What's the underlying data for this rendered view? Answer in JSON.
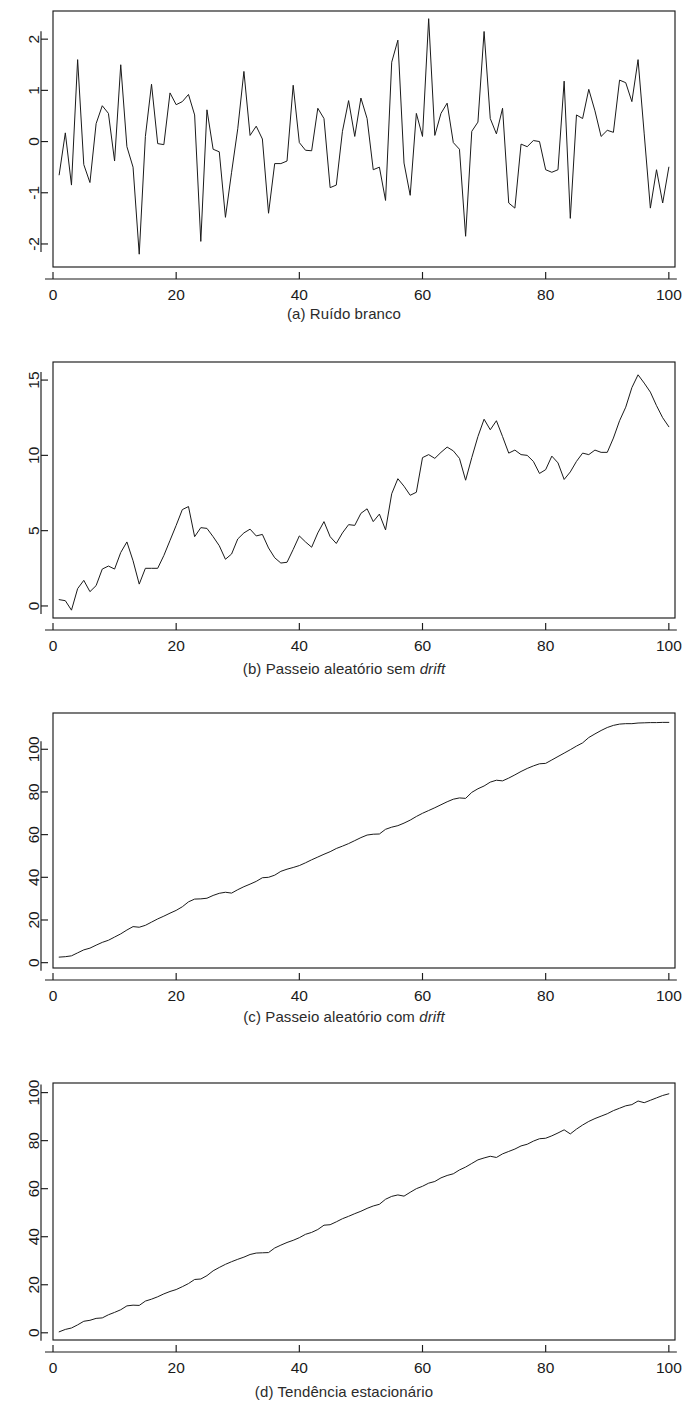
{
  "figure": {
    "background": "#ffffff",
    "line_color": "#1a1a1a",
    "text_color": "#1a1a1a",
    "width": 688,
    "height": 1425
  },
  "panels": [
    {
      "id": "a",
      "caption_prefix": "(a) Ruído branco",
      "caption_plain": "(a) Ruído branco",
      "caption_italic": ""
    },
    {
      "id": "b",
      "caption_prefix": "(b) Passeio aleatório sem ",
      "caption_plain": "(b) Passeio aleatório sem ",
      "caption_italic": "drift"
    },
    {
      "id": "c",
      "caption_prefix": "(c) Passeio aleatório com ",
      "caption_plain": "(c) Passeio aleatório com ",
      "caption_italic": "drift"
    },
    {
      "id": "d",
      "caption_prefix": "(d) Tendência estacionário",
      "caption_plain": "(d) Tendência estacionário",
      "caption_italic": ""
    }
  ],
  "chart_data": [
    {
      "type": "line",
      "panel": "a",
      "title": "(a) Ruído branco",
      "xlabel": "",
      "ylabel": "",
      "xlim": [
        0,
        101
      ],
      "ylim": [
        -2.45,
        2.55
      ],
      "xticks": [
        0,
        20,
        40,
        60,
        80,
        100
      ],
      "yticks": [
        -2,
        -1,
        0,
        1,
        2
      ],
      "xticklabels": [
        "0",
        "20",
        "40",
        "60",
        "80",
        "100"
      ],
      "yticklabels": [
        "-2",
        "-1",
        "0",
        "1",
        "2"
      ],
      "grid": false,
      "legend": null,
      "x": [
        1,
        2,
        3,
        4,
        5,
        6,
        7,
        8,
        9,
        10,
        11,
        12,
        13,
        14,
        15,
        16,
        17,
        18,
        19,
        20,
        21,
        22,
        23,
        24,
        25,
        26,
        27,
        28,
        29,
        30,
        31,
        32,
        33,
        34,
        35,
        36,
        37,
        38,
        39,
        40,
        41,
        42,
        43,
        44,
        45,
        46,
        47,
        48,
        49,
        50,
        51,
        52,
        53,
        54,
        55,
        56,
        57,
        58,
        59,
        60,
        61,
        62,
        63,
        64,
        65,
        66,
        67,
        68,
        69,
        70,
        71,
        72,
        73,
        74,
        75,
        76,
        77,
        78,
        79,
        80,
        81,
        82,
        83,
        84,
        85,
        86,
        87,
        88,
        89,
        90,
        91,
        92,
        93,
        94,
        95,
        96,
        97,
        98,
        99,
        100
      ],
      "values": [
        -0.65,
        0.17,
        -0.85,
        1.6,
        -0.45,
        -0.8,
        0.35,
        0.7,
        0.55,
        -0.38,
        1.5,
        -0.1,
        -0.5,
        -2.2,
        0.1,
        1.12,
        -0.04,
        -0.06,
        0.95,
        0.72,
        0.78,
        0.92,
        0.52,
        -1.95,
        0.62,
        -0.15,
        -0.2,
        -1.48,
        -0.6,
        0.25,
        1.37,
        0.12,
        0.3,
        0.05,
        -1.4,
        -0.43,
        -0.43,
        -0.38,
        1.1,
        -0.02,
        -0.17,
        -0.18,
        0.65,
        0.45,
        -0.9,
        -0.85,
        0.2,
        0.8,
        0.1,
        0.85,
        0.45,
        -0.55,
        -0.5,
        -1.15,
        1.55,
        1.98,
        -0.42,
        -1.05,
        0.55,
        0.1,
        2.4,
        0.12,
        0.55,
        0.75,
        -0.02,
        -0.15,
        -1.85,
        0.2,
        0.38,
        2.15,
        0.45,
        0.15,
        0.65,
        -1.2,
        -1.3,
        -0.05,
        -0.1,
        0.02,
        0.0,
        -0.55,
        -0.6,
        -0.55,
        1.18,
        -1.5,
        0.52,
        0.45,
        1.02,
        0.6,
        0.1,
        0.22,
        0.18,
        1.2,
        1.15,
        0.78,
        1.6,
        0.15,
        -1.3,
        -0.55,
        -1.2,
        -0.5
      ]
    },
    {
      "type": "line",
      "panel": "b",
      "title": "(b) Passeio aleatório sem drift",
      "xlabel": "",
      "ylabel": "",
      "xlim": [
        0,
        101
      ],
      "ylim": [
        -0.8,
        16.2
      ],
      "xticks": [
        0,
        20,
        40,
        60,
        80,
        100
      ],
      "yticks": [
        0,
        5,
        10,
        15
      ],
      "xticklabels": [
        "0",
        "20",
        "40",
        "60",
        "80",
        "100"
      ],
      "yticklabels": [
        "0",
        "5",
        "10",
        "15"
      ],
      "grid": false,
      "legend": null,
      "x": [
        1,
        2,
        3,
        4,
        5,
        6,
        7,
        8,
        9,
        10,
        11,
        12,
        13,
        14,
        15,
        16,
        17,
        18,
        19,
        20,
        21,
        22,
        23,
        24,
        25,
        26,
        27,
        28,
        29,
        30,
        31,
        32,
        33,
        34,
        35,
        36,
        37,
        38,
        39,
        40,
        41,
        42,
        43,
        44,
        45,
        46,
        47,
        48,
        49,
        50,
        51,
        52,
        53,
        54,
        55,
        56,
        57,
        58,
        59,
        60,
        61,
        62,
        63,
        64,
        65,
        66,
        67,
        68,
        69,
        70,
        71,
        72,
        73,
        74,
        75,
        76,
        77,
        78,
        79,
        80,
        81,
        82,
        83,
        84,
        85,
        86,
        87,
        88,
        89,
        90,
        91,
        92,
        93,
        94,
        95,
        96,
        97,
        98,
        99,
        100
      ],
      "values": [
        0.42,
        0.35,
        -0.28,
        1.15,
        1.7,
        0.95,
        1.35,
        2.45,
        2.65,
        2.45,
        3.55,
        4.25,
        3.0,
        1.45,
        2.5,
        2.5,
        2.5,
        3.35,
        4.35,
        5.35,
        6.4,
        6.6,
        4.6,
        5.2,
        5.15,
        4.6,
        4.0,
        3.1,
        3.45,
        4.45,
        4.85,
        5.1,
        4.65,
        4.75,
        3.85,
        3.2,
        2.85,
        2.9,
        3.75,
        4.65,
        4.25,
        3.9,
        4.85,
        5.6,
        4.6,
        4.15,
        4.85,
        5.4,
        5.35,
        6.15,
        6.45,
        5.6,
        6.1,
        5.05,
        7.45,
        8.45,
        7.95,
        7.35,
        7.55,
        9.85,
        10.05,
        9.8,
        10.2,
        10.55,
        10.3,
        9.8,
        8.35,
        9.85,
        11.25,
        12.4,
        11.7,
        12.3,
        11.25,
        10.15,
        10.35,
        10.05,
        10.0,
        9.6,
        8.8,
        9.05,
        9.95,
        9.5,
        8.4,
        8.9,
        9.6,
        10.15,
        10.05,
        10.35,
        10.2,
        10.2,
        11.15,
        12.3,
        13.2,
        14.5,
        15.35,
        14.8,
        14.2,
        13.3,
        12.5,
        11.9
      ]
    },
    {
      "type": "line",
      "panel": "c",
      "title": "(c) Passeio aleatório com drift",
      "xlabel": "",
      "ylabel": "",
      "xlim": [
        0,
        101
      ],
      "ylim": [
        -2.5,
        117
      ],
      "xticks": [
        0,
        20,
        40,
        60,
        80,
        100
      ],
      "yticks": [
        0,
        20,
        40,
        60,
        80,
        100
      ],
      "xticklabels": [
        "0",
        "20",
        "40",
        "60",
        "80",
        "100"
      ],
      "yticklabels": [
        "0",
        "20",
        "40",
        "60",
        "80",
        "100"
      ],
      "grid": false,
      "legend": null,
      "x": [
        1,
        2,
        3,
        4,
        5,
        6,
        7,
        8,
        9,
        10,
        11,
        12,
        13,
        14,
        15,
        16,
        17,
        18,
        19,
        20,
        21,
        22,
        23,
        24,
        25,
        26,
        27,
        28,
        29,
        30,
        31,
        32,
        33,
        34,
        35,
        36,
        37,
        38,
        39,
        40,
        41,
        42,
        43,
        44,
        45,
        46,
        47,
        48,
        49,
        50,
        51,
        52,
        53,
        54,
        55,
        56,
        57,
        58,
        59,
        60,
        61,
        62,
        63,
        64,
        65,
        66,
        67,
        68,
        69,
        70,
        71,
        72,
        73,
        74,
        75,
        76,
        77,
        78,
        79,
        80,
        81,
        82,
        83,
        84,
        85,
        86,
        87,
        88,
        89,
        90,
        91,
        92,
        93,
        94,
        95,
        96,
        97,
        98,
        99,
        100
      ],
      "values": [
        2.6,
        2.8,
        3.2,
        4.6,
        6.0,
        6.8,
        8.2,
        9.5,
        10.5,
        12.0,
        13.5,
        15.3,
        16.9,
        16.6,
        17.5,
        19.0,
        20.5,
        21.8,
        23.2,
        24.5,
        26.2,
        28.5,
        29.8,
        29.9,
        30.2,
        31.5,
        32.5,
        33.0,
        32.6,
        34.2,
        35.6,
        36.8,
        38.1,
        39.8,
        40.0,
        41.0,
        42.8,
        43.8,
        44.6,
        45.5,
        46.8,
        48.2,
        49.5,
        50.8,
        52.0,
        53.5,
        54.6,
        55.8,
        57.2,
        58.6,
        59.8,
        60.2,
        60.3,
        62.5,
        63.5,
        64.2,
        65.4,
        66.8,
        68.5,
        70.0,
        71.3,
        72.6,
        74.0,
        75.4,
        76.6,
        77.2,
        77.0,
        79.8,
        81.5,
        82.8,
        84.6,
        85.5,
        85.2,
        86.5,
        88.0,
        89.6,
        91.0,
        92.2,
        93.2,
        93.4,
        95.0,
        96.6,
        98.2,
        99.8,
        101.5,
        103.0,
        105.5,
        107.2,
        108.8,
        110.2,
        111.2,
        111.8,
        112.0,
        112.0,
        112.3,
        112.4,
        112.5,
        112.5,
        112.6,
        112.6
      ]
    },
    {
      "type": "line",
      "panel": "d",
      "title": "(d) Tendência estacionário",
      "xlabel": "",
      "ylabel": "",
      "xlim": [
        0,
        101
      ],
      "ylim": [
        -3.0,
        104
      ],
      "xticks": [
        0,
        20,
        40,
        60,
        80,
        100
      ],
      "yticks": [
        0,
        20,
        40,
        60,
        80,
        100
      ],
      "xticklabels": [
        "0",
        "20",
        "40",
        "60",
        "80",
        "100"
      ],
      "yticklabels": [
        "0",
        "20",
        "40",
        "60",
        "80",
        "100"
      ],
      "grid": false,
      "legend": null,
      "x": [
        1,
        2,
        3,
        4,
        5,
        6,
        7,
        8,
        9,
        10,
        11,
        12,
        13,
        14,
        15,
        16,
        17,
        18,
        19,
        20,
        21,
        22,
        23,
        24,
        25,
        26,
        27,
        28,
        29,
        30,
        31,
        32,
        33,
        34,
        35,
        36,
        37,
        38,
        39,
        40,
        41,
        42,
        43,
        44,
        45,
        46,
        47,
        48,
        49,
        50,
        51,
        52,
        53,
        54,
        55,
        56,
        57,
        58,
        59,
        60,
        61,
        62,
        63,
        64,
        65,
        66,
        67,
        68,
        69,
        70,
        71,
        72,
        73,
        74,
        75,
        76,
        77,
        78,
        79,
        80,
        81,
        82,
        83,
        84,
        85,
        86,
        87,
        88,
        89,
        90,
        91,
        92,
        93,
        94,
        95,
        96,
        97,
        98,
        99,
        100
      ],
      "values": [
        0.4,
        1.4,
        2.0,
        3.3,
        4.8,
        5.2,
        6.0,
        6.2,
        7.5,
        8.5,
        9.6,
        11.2,
        11.5,
        11.4,
        13.2,
        14.0,
        15.0,
        16.2,
        17.2,
        18.0,
        19.2,
        20.5,
        22.2,
        22.4,
        23.8,
        25.8,
        27.2,
        28.5,
        29.6,
        30.6,
        31.5,
        32.6,
        33.2,
        33.3,
        33.4,
        35.3,
        36.5,
        37.6,
        38.5,
        39.6,
        41.0,
        41.8,
        43.0,
        44.8,
        45.0,
        46.2,
        47.5,
        48.5,
        49.6,
        50.6,
        51.8,
        52.8,
        53.5,
        55.6,
        56.8,
        57.4,
        56.9,
        58.5,
        60.0,
        61.0,
        62.3,
        63.0,
        64.5,
        65.5,
        66.2,
        67.8,
        69.0,
        70.5,
        72.0,
        72.8,
        73.5,
        73.0,
        74.5,
        75.5,
        76.5,
        77.8,
        78.5,
        79.8,
        80.8,
        81.0,
        82.0,
        83.2,
        84.5,
        82.8,
        84.8,
        86.5,
        88.0,
        89.2,
        90.2,
        91.2,
        92.5,
        93.5,
        94.5,
        95.0,
        96.5,
        95.8,
        96.8,
        97.8,
        98.8,
        99.5
      ]
    }
  ]
}
